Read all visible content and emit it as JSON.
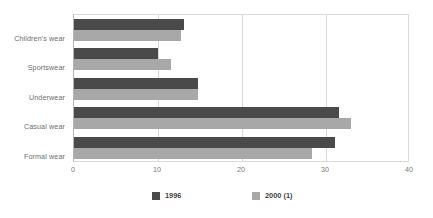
{
  "chart_data": {
    "type": "bar",
    "orientation": "horizontal",
    "title": "",
    "xlabel": "",
    "ylabel": "",
    "categories": [
      "Children's wear",
      "Sportswear",
      "Underwear",
      "Casual wear",
      "Formal wear"
    ],
    "series": [
      {
        "name": "1996",
        "color": "#4a4a4a",
        "values": [
          13.1,
          10.0,
          14.8,
          31.5,
          31.1
        ]
      },
      {
        "name": "2000 (1)",
        "color": "#a8a8a8",
        "values": [
          12.7,
          11.5,
          14.8,
          33.0,
          28.3
        ]
      }
    ],
    "xlim": [
      0,
      40
    ],
    "xticks": [
      0,
      10,
      20,
      30,
      40
    ],
    "xtick_labels": [
      "0",
      "10",
      "20",
      "30",
      "40"
    ],
    "grid": true,
    "grid_axis": "x",
    "legend_position": "bottom",
    "legend_entries": [
      "1996",
      "2000 (1)"
    ]
  },
  "colors": {
    "series_1996": "#4a4a4a",
    "series_2000": "#a8a8a8",
    "gridline": "#d9d9d9",
    "axis": "#b5b5b5",
    "label_text": "#6e6e6e",
    "tick_text": "#7a7a7a",
    "legend_text": "#3f3f3f",
    "background": "#ffffff"
  }
}
